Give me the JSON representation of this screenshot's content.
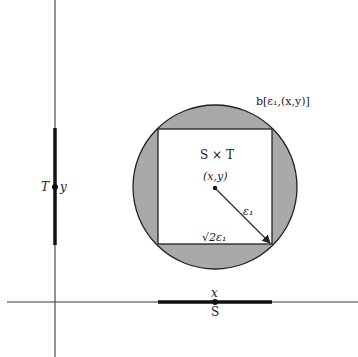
{
  "labels": {
    "ball": "b[ε₁,(x,y)]",
    "product": "S × T",
    "point": "(x,y)",
    "radius": "ε₁",
    "side": "√2ε₁",
    "y_axis_set": "T",
    "y_axis_point": "y",
    "x_axis_point": "x",
    "x_axis_set": "S"
  },
  "colors": {
    "axis": "#3a3a3a",
    "segment": "#111111",
    "shade": "#a9a9a9",
    "square_fill": "#ffffff",
    "outline": "#222222"
  },
  "geometry": {
    "origin": [
      55,
      302
    ],
    "center": [
      215,
      187
    ],
    "radius": 82,
    "square": {
      "x": 158,
      "y": 129,
      "size": 115
    },
    "x_segment": [
      158,
      272
    ],
    "y_segment": [
      128,
      245
    ]
  }
}
